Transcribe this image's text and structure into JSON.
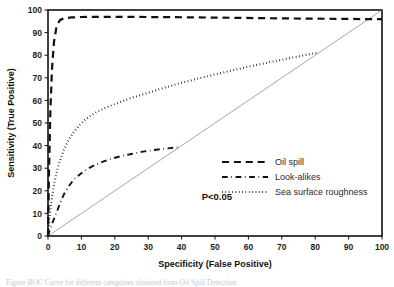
{
  "figure": {
    "caption_fragment": "Figure  ROC Curve for different categories obtained from Oil Spill Detection"
  },
  "chart_data": {
    "type": "line",
    "title": "",
    "xlabel": "Specificity (False Positive)",
    "ylabel": "Sensitivity (True Positive)",
    "xlim": [
      0,
      100
    ],
    "ylim": [
      0,
      100
    ],
    "xticks": [
      0,
      10,
      20,
      30,
      40,
      50,
      60,
      70,
      80,
      90,
      100
    ],
    "yticks": [
      0,
      10,
      20,
      30,
      40,
      50,
      60,
      70,
      80,
      90,
      100
    ],
    "grid": false,
    "legend_position": "center-right",
    "annotations": [
      {
        "text": "P<0.05",
        "x": 46,
        "y": 16
      }
    ],
    "reference_line": {
      "name": "chance-diagonal",
      "x": [
        0,
        100
      ],
      "y": [
        0,
        100
      ],
      "style": "solid",
      "color": "#808080",
      "width": 0.7
    },
    "series": [
      {
        "name": "Oil spill",
        "style": "dashed",
        "color": "#111111",
        "width": 2.2,
        "x": [
          0,
          0.3,
          0.7,
          1.2,
          1.8,
          2.6,
          3.6,
          5,
          7,
          10,
          15,
          22,
          30,
          40,
          52,
          64,
          76,
          86,
          94,
          100
        ],
        "y": [
          0,
          28,
          55,
          74,
          86,
          93,
          95.6,
          96.4,
          96.7,
          96.9,
          97,
          97,
          96.9,
          96.8,
          96.6,
          96.4,
          96.2,
          96.1,
          96,
          96
        ]
      },
      {
        "name": "Look-alikes",
        "style": "dashdot",
        "color": "#111111",
        "width": 1.9,
        "x": [
          0,
          0.6,
          1.5,
          2.6,
          3.6,
          4.8,
          6.2,
          8,
          10,
          12,
          14,
          16.5,
          19,
          22,
          25,
          28,
          31,
          34,
          36.5,
          38.8
        ],
        "y": [
          0,
          3,
          6.5,
          10.5,
          14.5,
          18.5,
          22,
          25.5,
          27.8,
          29.8,
          31.4,
          32.9,
          34.2,
          35.4,
          36.3,
          37.2,
          37.9,
          38.5,
          38.9,
          39.2
        ]
      },
      {
        "name": "Sea surface roughness",
        "style": "dotted",
        "color": "#111111",
        "width": 2.1,
        "x": [
          0,
          0.4,
          0.9,
          1.6,
          2.4,
          3.4,
          4.6,
          6,
          7.6,
          9.5,
          11.5,
          14,
          17,
          20,
          24,
          28,
          33,
          39,
          45,
          52,
          59,
          66,
          73,
          81
        ],
        "y": [
          0,
          7,
          14,
          21,
          27,
          32.5,
          37.5,
          42,
          45.8,
          49.2,
          52,
          54.4,
          56.6,
          58.4,
          60.6,
          62.5,
          64.8,
          67.4,
          69.7,
          72.2,
          74.6,
          76.8,
          78.9,
          81.2
        ]
      }
    ]
  },
  "legend": {
    "items": [
      {
        "label": "Oil spill",
        "style": "dashed"
      },
      {
        "label": "Look-alikes",
        "style": "dashdot"
      },
      {
        "label": "Sea surface roughness",
        "style": "dotted"
      }
    ]
  }
}
